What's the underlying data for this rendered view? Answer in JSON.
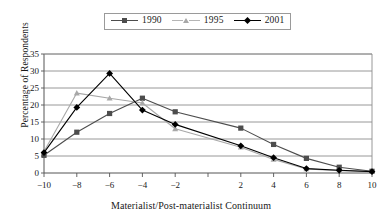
{
  "chart_data": {
    "type": "line",
    "title": "",
    "xlabel": "Materialist/Post-materialist Continuum",
    "ylabel": "Percentage of Respondents",
    "x": [
      -10,
      -8,
      -6,
      -4,
      -2,
      0,
      2,
      4,
      6,
      8,
      10
    ],
    "xtick_labels": [
      "-10",
      "-8",
      "-6",
      "-4",
      "-2",
      "",
      "2",
      "4",
      "6",
      "8",
      "10"
    ],
    "ytick_labels": [
      "0",
      "5",
      "10",
      "15",
      "20",
      "25",
      "30",
      "35"
    ],
    "xlim": [
      -11,
      11
    ],
    "ylim": [
      0,
      35
    ],
    "grid": "horizontal",
    "legend_position": "top-center",
    "series": [
      {
        "name": "1990",
        "marker": "square",
        "color": "#4d4d4d",
        "values": [
          5.2,
          12.0,
          17.5,
          22.0,
          18.0,
          null,
          13.2,
          8.4,
          4.3,
          1.7,
          0.5
        ]
      },
      {
        "name": "1995",
        "marker": "triangle",
        "color": "#a8a8a8",
        "values": [
          6.3,
          23.5,
          22.0,
          20.6,
          13.0,
          null,
          7.6,
          4.0,
          1.2,
          0.7,
          0.4
        ]
      },
      {
        "name": "2001",
        "marker": "diamond",
        "color": "#000000",
        "values": [
          6.0,
          19.3,
          29.3,
          18.5,
          14.3,
          null,
          8.0,
          4.5,
          1.3,
          0.8,
          0.4
        ]
      }
    ]
  },
  "legend": {
    "items": [
      {
        "label": "1990"
      },
      {
        "label": "1995"
      },
      {
        "label": "2001"
      }
    ]
  },
  "axes": {
    "y_title": "Percentage of Respondents",
    "x_title": "Materialist/Post-materialist Continuum"
  }
}
